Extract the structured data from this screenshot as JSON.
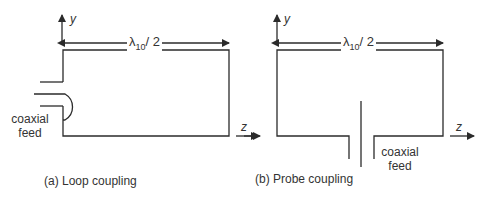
{
  "figure": {
    "panels": [
      {
        "id": "a",
        "caption": "(a) Loop coupling",
        "dimension": {
          "symbol": "λ",
          "subscript": "10",
          "suffix": "/ 2"
        },
        "axes": {
          "y": "y",
          "z": "z"
        },
        "feed_label": {
          "line1": "coaxial",
          "line2": "feed"
        }
      },
      {
        "id": "b",
        "caption": "(b) Probe coupling",
        "dimension": {
          "symbol": "λ",
          "subscript": "10",
          "suffix": "/ 2"
        },
        "axes": {
          "y": "y",
          "z": "z"
        },
        "feed_label": {
          "line1": "coaxial",
          "line2": "feed"
        }
      }
    ],
    "colors": {
      "line": "#2b2b2b",
      "background": "#ffffff"
    }
  }
}
